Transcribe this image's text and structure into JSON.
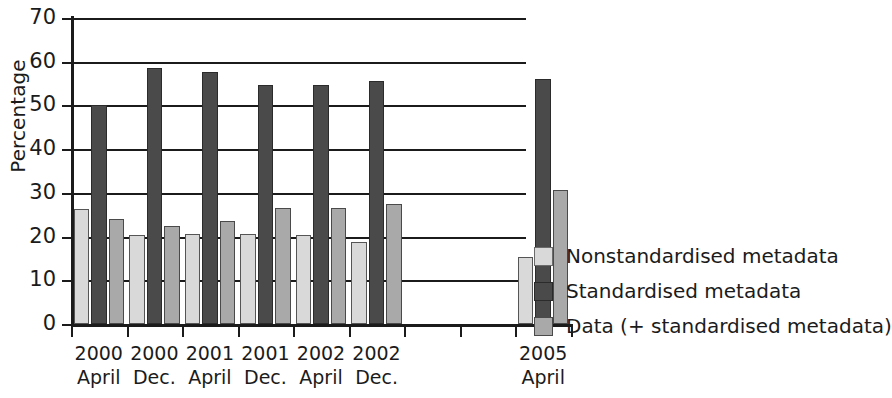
{
  "chart_data": {
    "type": "bar",
    "title": "",
    "subtitle": "",
    "xlabel": "",
    "ylabel": "Percentage",
    "ylim": [
      0,
      70
    ],
    "yticks": [
      0,
      10,
      20,
      30,
      40,
      50,
      60,
      70
    ],
    "grid": true,
    "legend_position": "right",
    "categories": [
      "2000 April",
      "2000 Dec.",
      "2001 April",
      "2001 Dec.",
      "2002 April",
      "2002 Dec.",
      "2003",
      "2004",
      "2005 April"
    ],
    "category_lines": [
      {
        "line1": "2000",
        "line2": "April"
      },
      {
        "line1": "2000",
        "line2": "Dec."
      },
      {
        "line1": "2001",
        "line2": "April"
      },
      {
        "line1": "2001",
        "line2": "Dec."
      },
      {
        "line1": "2002",
        "line2": "April"
      },
      {
        "line1": "2002",
        "line2": "Dec."
      },
      {
        "line1": "",
        "line2": ""
      },
      {
        "line1": "",
        "line2": ""
      },
      {
        "line1": "2005",
        "line2": "April"
      }
    ],
    "series": [
      {
        "name": "Nonstandardised metadata",
        "color": "#d9d9d9",
        "values": [
          26.3,
          20.4,
          20.6,
          20.7,
          20.4,
          18.7,
          null,
          null,
          15.4
        ]
      },
      {
        "name": "Standardised metadata",
        "color": "#4a4a4a",
        "values": [
          50.1,
          58.6,
          57.7,
          54.7,
          54.7,
          55.5,
          null,
          null,
          56.0
        ]
      },
      {
        "name": "Data (+ standardised metadata)",
        "color": "#a9a9a9",
        "values": [
          24.0,
          22.4,
          23.5,
          26.6,
          26.5,
          27.4,
          null,
          null,
          30.6
        ]
      }
    ]
  },
  "legend": {
    "items": [
      {
        "label": "Nonstandardised metadata",
        "color": "#d9d9d9"
      },
      {
        "label": "Standardised metadata",
        "color": "#4a4a4a"
      },
      {
        "label": "Data (+ standardised metadata)",
        "color": "#a9a9a9"
      }
    ]
  },
  "axes": {
    "y_title": "Percentage",
    "y_tick_labels": [
      "0",
      "10",
      "20",
      "30",
      "40",
      "50",
      "60",
      "70"
    ]
  }
}
